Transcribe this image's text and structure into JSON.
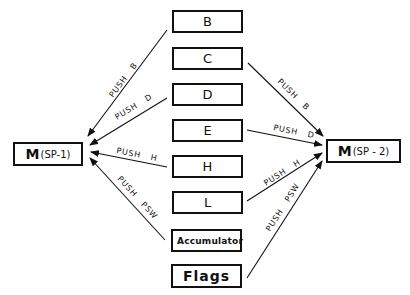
{
  "diagram": {
    "registers": [
      {
        "id": "B",
        "label": "B"
      },
      {
        "id": "C",
        "label": "C"
      },
      {
        "id": "D",
        "label": "D"
      },
      {
        "id": "E",
        "label": "E"
      },
      {
        "id": "H",
        "label": "H"
      },
      {
        "id": "L",
        "label": "L"
      },
      {
        "id": "A",
        "label": "Accumulator"
      },
      {
        "id": "F",
        "label": "Flags"
      }
    ],
    "memory_left": {
      "m": "M",
      "addr": "(SP-1)"
    },
    "memory_right": {
      "m": "M",
      "addr": "(SP - 2)"
    },
    "arrows_left": [
      {
        "from": "B",
        "to": "M(SP-1)",
        "label": "PUSH   B"
      },
      {
        "from": "D",
        "to": "M(SP-1)",
        "label": "PUSH   D"
      },
      {
        "from": "H",
        "to": "M(SP-1)",
        "label": "PUSH   H"
      },
      {
        "from": "Accumulator",
        "to": "M(SP-1)",
        "label": "PUSH   PSW"
      }
    ],
    "arrows_right": [
      {
        "from": "C",
        "to": "M(SP-2)",
        "label": "PUSH   B"
      },
      {
        "from": "E",
        "to": "M(SP-2)",
        "label": "PUSH   D"
      },
      {
        "from": "L",
        "to": "M(SP-2)",
        "label": "PUSH   H"
      },
      {
        "from": "Flags",
        "to": "M(SP-2)",
        "label": "PUSH   PSW"
      }
    ],
    "colors": {
      "line": "#111111",
      "background": "#ffffff"
    }
  }
}
